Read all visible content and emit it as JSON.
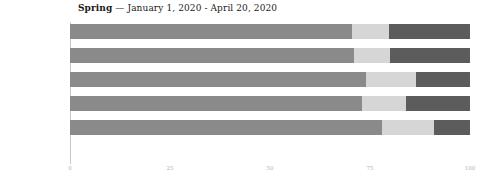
{
  "title": {
    "season": "Spring",
    "separator": " — ",
    "daterange": "January 1, 2020 - April 20, 2020"
  },
  "axis": {
    "xticks": [
      "0",
      "25",
      "50",
      "75",
      "100"
    ],
    "xtick_values": [
      0,
      25,
      50,
      75,
      100
    ]
  },
  "colors": {
    "segment_1": "#8a8a8a",
    "segment_2": "#d6d6d6",
    "segment_3": "#5c5c5c",
    "axis_line": "#c9c9c9",
    "tick_text": "#b4b4b4",
    "label_text": "#2b2b2b",
    "title_text": "#1a1a1a",
    "background": "#ffffff"
  },
  "chart_data": {
    "type": "bar",
    "orientation": "horizontal",
    "stacked": true,
    "normalized": true,
    "title": "Spring — January 1, 2020 - April 20, 2020",
    "xlabel": "",
    "ylabel": "",
    "xlim": [
      0,
      100
    ],
    "grid": false,
    "legend": "none",
    "categories": [
      "gop",
      "realdonaldtrump",
      "berniesanders",
      "thedemocrats",
      "joebiden"
    ],
    "series": [
      {
        "name": "segment_1",
        "color": "#8a8a8a",
        "values": [
          70.5,
          71.0,
          74.0,
          73.0,
          78.0
        ]
      },
      {
        "name": "segment_2",
        "color": "#d6d6d6",
        "values": [
          9.25,
          9.0,
          12.5,
          11.0,
          13.0
        ]
      },
      {
        "name": "segment_3",
        "color": "#5c5c5c",
        "values": [
          20.25,
          20.0,
          13.5,
          16.0,
          9.0
        ]
      }
    ]
  }
}
